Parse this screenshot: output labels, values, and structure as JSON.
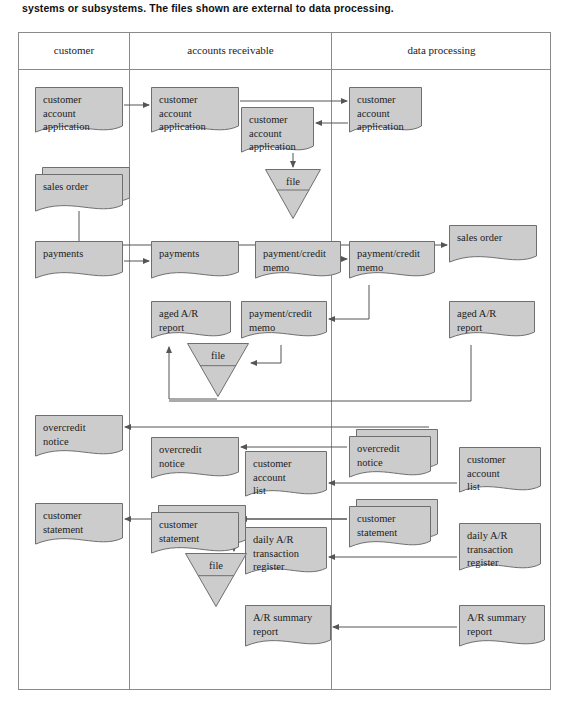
{
  "caption": "systems or subsystems. The files shown are external to data processing.",
  "colors": {
    "shape_fill": "#cccccc",
    "shape_stroke": "#6e6e6e",
    "frame_stroke": "#8a8a8a",
    "connector": "#555555",
    "text": "#1d1d1d"
  },
  "columns": [
    {
      "id": "customer",
      "label": "customer"
    },
    {
      "id": "accounts-receivable",
      "label": "accounts receivable"
    },
    {
      "id": "data-processing",
      "label": "data processing"
    }
  ],
  "diagram": {
    "type": "document-flowchart",
    "nodes": [
      {
        "id": "n1",
        "shape": "document",
        "column": "customer",
        "label": "customer\naccount\napplication",
        "x": 16,
        "y": 54,
        "w": 88,
        "h": 50,
        "stacked": false
      },
      {
        "id": "n2",
        "shape": "document",
        "column": "accounts-receivable",
        "label": "customer\naccount\napplication",
        "x": 132,
        "y": 54,
        "w": 88,
        "h": 50,
        "stacked": false
      },
      {
        "id": "n3",
        "shape": "document",
        "column": "accounts-receivable",
        "label": "customer\naccount\napplication",
        "x": 222,
        "y": 74,
        "w": 73,
        "h": 50,
        "stacked": false
      },
      {
        "id": "n4",
        "shape": "file",
        "column": "accounts-receivable",
        "label": "file",
        "x": 246,
        "y": 136,
        "w": 56,
        "h": 50
      },
      {
        "id": "n5",
        "shape": "document",
        "column": "data-processing",
        "label": "customer\naccount\napplication",
        "x": 330,
        "y": 54,
        "w": 73,
        "h": 50,
        "stacked": false
      },
      {
        "id": "n6",
        "shape": "document",
        "column": "customer",
        "label": "sales order",
        "x": 16,
        "y": 134,
        "w": 88,
        "h": 42,
        "stacked": true
      },
      {
        "id": "n7",
        "shape": "document",
        "column": "data-processing",
        "label": "sales order",
        "x": 430,
        "y": 192,
        "w": 88,
        "h": 42,
        "stacked": false
      },
      {
        "id": "n8",
        "shape": "document",
        "column": "customer",
        "label": "payments",
        "x": 16,
        "y": 208,
        "w": 88,
        "h": 42,
        "stacked": false
      },
      {
        "id": "n9",
        "shape": "document",
        "column": "accounts-receivable",
        "label": "payments",
        "x": 132,
        "y": 208,
        "w": 88,
        "h": 42,
        "stacked": false
      },
      {
        "id": "n10",
        "shape": "document",
        "column": "accounts-receivable",
        "label": "payment/credit\nmemo",
        "x": 236,
        "y": 208,
        "w": 86,
        "h": 42,
        "stacked": false
      },
      {
        "id": "n11",
        "shape": "document",
        "column": "data-processing",
        "label": "payment/credit\nmemo",
        "x": 330,
        "y": 208,
        "w": 86,
        "h": 42,
        "stacked": false
      },
      {
        "id": "n12",
        "shape": "document",
        "column": "accounts-receivable",
        "label": "aged A/R\nreport",
        "x": 132,
        "y": 268,
        "w": 80,
        "h": 42,
        "stacked": false
      },
      {
        "id": "n13",
        "shape": "document",
        "column": "accounts-receivable",
        "label": "payment/credit\nmemo",
        "x": 222,
        "y": 268,
        "w": 86,
        "h": 42,
        "stacked": false
      },
      {
        "id": "n14",
        "shape": "file",
        "column": "accounts-receivable",
        "label": "file",
        "x": 168,
        "y": 310,
        "w": 62,
        "h": 54
      },
      {
        "id": "n15",
        "shape": "document",
        "column": "data-processing",
        "label": "aged A/R\nreport",
        "x": 430,
        "y": 268,
        "w": 86,
        "h": 42,
        "stacked": false
      },
      {
        "id": "n16",
        "shape": "document",
        "column": "customer",
        "label": "overcredit\nnotice",
        "x": 16,
        "y": 382,
        "w": 88,
        "h": 46,
        "stacked": false
      },
      {
        "id": "n17",
        "shape": "document",
        "column": "accounts-receivable",
        "label": "overcredit\nnotice",
        "x": 132,
        "y": 404,
        "w": 88,
        "h": 46,
        "stacked": false
      },
      {
        "id": "n18",
        "shape": "document",
        "column": "accounts-receivable",
        "label": "customer\naccount\nlist",
        "x": 226,
        "y": 418,
        "w": 82,
        "h": 50,
        "stacked": false
      },
      {
        "id": "n19",
        "shape": "document",
        "column": "data-processing",
        "label": "overcredit\nnotice",
        "x": 330,
        "y": 396,
        "w": 82,
        "h": 46,
        "stacked": true
      },
      {
        "id": "n20",
        "shape": "document",
        "column": "data-processing",
        "label": "customer\naccount\nlist",
        "x": 440,
        "y": 414,
        "w": 82,
        "h": 50,
        "stacked": false
      },
      {
        "id": "n21",
        "shape": "document",
        "column": "customer",
        "label": "customer\nstatement",
        "x": 16,
        "y": 470,
        "w": 88,
        "h": 46,
        "stacked": false
      },
      {
        "id": "n22",
        "shape": "document",
        "column": "accounts-receivable",
        "label": "customer\nstatement",
        "x": 132,
        "y": 472,
        "w": 88,
        "h": 46,
        "stacked": true
      },
      {
        "id": "n23",
        "shape": "document",
        "column": "accounts-receivable",
        "label": "daily A/R\ntransaction\nregister",
        "x": 226,
        "y": 494,
        "w": 82,
        "h": 52,
        "stacked": false
      },
      {
        "id": "n24",
        "shape": "file",
        "column": "accounts-receivable",
        "label": "file",
        "x": 166,
        "y": 520,
        "w": 62,
        "h": 54
      },
      {
        "id": "n25",
        "shape": "document",
        "column": "data-processing",
        "label": "customer\nstatement",
        "x": 330,
        "y": 466,
        "w": 82,
        "h": 46,
        "stacked": true
      },
      {
        "id": "n26",
        "shape": "document",
        "column": "data-processing",
        "label": "daily A/R\ntransaction\nregister",
        "x": 440,
        "y": 490,
        "w": 82,
        "h": 52,
        "stacked": false
      },
      {
        "id": "n27",
        "shape": "document",
        "column": "accounts-receivable",
        "label": "A/R summary\nreport",
        "x": 226,
        "y": 572,
        "w": 86,
        "h": 46,
        "stacked": false
      },
      {
        "id": "n28",
        "shape": "document",
        "column": "data-processing",
        "label": "A/R summary\nreport",
        "x": 440,
        "y": 572,
        "w": 86,
        "h": 46,
        "stacked": false
      }
    ],
    "edges": [
      {
        "from": "n1",
        "to": "n2",
        "name": "customer-application-to-ar"
      },
      {
        "from": "n2",
        "to": "n5",
        "name": "ar-application-to-dp"
      },
      {
        "from": "n5",
        "to": "n3",
        "name": "dp-application-back-to-ar"
      },
      {
        "from": "n3",
        "to": "n4",
        "name": "ar-application-to-file"
      },
      {
        "from": "n6",
        "to": "n7",
        "name": "sales-order-to-dp"
      },
      {
        "from": "n8",
        "to": "n9",
        "name": "payments-to-ar"
      },
      {
        "from": "n10",
        "to": "n11",
        "name": "payment-memo-to-dp"
      },
      {
        "from": "n11",
        "to": "n13",
        "name": "dp-memo-back-to-ar"
      },
      {
        "from": "n13",
        "to": "n14",
        "name": "memo-to-file"
      },
      {
        "from": "n14",
        "to": "n12",
        "name": "file-to-aged-ar-report"
      },
      {
        "from": "n15",
        "to": "n12",
        "name": "dp-aged-ar-to-ar"
      },
      {
        "from": "n19",
        "to": "n16",
        "name": "overcredit-to-customer"
      },
      {
        "from": "n19",
        "to": "n17",
        "name": "overcredit-to-ar"
      },
      {
        "from": "n20",
        "to": "n18",
        "name": "account-list-to-ar"
      },
      {
        "from": "n25",
        "to": "n21",
        "name": "statement-to-customer"
      },
      {
        "from": "n25",
        "to": "n22",
        "name": "statement-to-ar"
      },
      {
        "from": "n22",
        "to": "n24",
        "name": "statement-to-file"
      },
      {
        "from": "n26",
        "to": "n23",
        "name": "daily-register-to-ar"
      },
      {
        "from": "n28",
        "to": "n27",
        "name": "summary-report-to-ar"
      }
    ]
  }
}
